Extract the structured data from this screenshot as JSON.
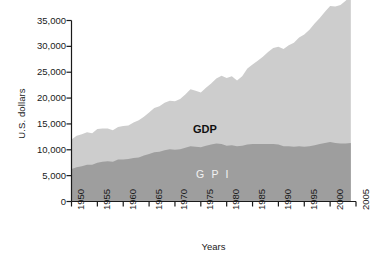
{
  "chart_data": {
    "type": "area",
    "stacked": false,
    "title": "",
    "xlabel": "Years",
    "ylabel": "U.S. dollars",
    "xlim": [
      1950,
      2005
    ],
    "ylim": [
      0,
      35000
    ],
    "ytick_labels": [
      "0",
      "5,000",
      "10,000",
      "15,000",
      "20,000",
      "25,000",
      "30,000",
      "35,000"
    ],
    "ytick_values": [
      0,
      5000,
      10000,
      15000,
      20000,
      25000,
      30000,
      35000
    ],
    "xtick_labels": [
      "1950",
      "1955",
      "1960",
      "1965",
      "1970",
      "1975",
      "1980",
      "1985",
      "1990",
      "1995",
      "2000",
      "2005"
    ],
    "xtick_values": [
      1950,
      1955,
      1960,
      1965,
      1970,
      1975,
      1980,
      1985,
      1990,
      1995,
      2000,
      2005
    ],
    "grid": false,
    "legend_position": "inline-annotation",
    "colors": {
      "gdp_fill": "#cdcdcd",
      "gpi_fill": "#9e9e9e",
      "axis": "#1a1a1a",
      "background": "#ffffff",
      "gdp_label_text": "#111111",
      "gpi_label_text": "#f2f2f2"
    },
    "annotations": [
      {
        "name": "gdp",
        "text": "GDP",
        "x": 1978,
        "y": 16000
      },
      {
        "name": "gpi",
        "text": "G P I",
        "x": 1978,
        "y": 5200
      }
    ],
    "x": [
      1950,
      1951,
      1952,
      1953,
      1954,
      1955,
      1956,
      1957,
      1958,
      1959,
      1960,
      1961,
      1962,
      1963,
      1964,
      1965,
      1966,
      1967,
      1968,
      1969,
      1970,
      1971,
      1972,
      1973,
      1974,
      1975,
      1976,
      1977,
      1978,
      1979,
      1980,
      1981,
      1982,
      1983,
      1984,
      1985,
      1986,
      1987,
      1988,
      1989,
      1990,
      1991,
      1992,
      1993,
      1994,
      1995,
      1996,
      1997,
      1998,
      1999,
      2000,
      2001,
      2002,
      2003,
      2004
    ],
    "series": [
      {
        "name": "GDP",
        "label": "GDP",
        "color": "#cdcdcd",
        "values": [
          12000,
          12700,
          13000,
          13400,
          13200,
          14000,
          14100,
          14100,
          13800,
          14400,
          14600,
          14700,
          15300,
          15700,
          16400,
          17200,
          18100,
          18400,
          19100,
          19500,
          19400,
          19800,
          20700,
          21700,
          21400,
          21100,
          22000,
          22800,
          23800,
          24300,
          23900,
          24200,
          23400,
          24200,
          25700,
          26500,
          27200,
          28000,
          28900,
          29700,
          29900,
          29500,
          30200,
          30700,
          31700,
          32300,
          33200,
          34400,
          35500,
          36700,
          37800,
          37700,
          38000,
          38800,
          40000
        ]
      },
      {
        "name": "GPI",
        "label": "G P I",
        "color": "#9e9e9e",
        "values": [
          6300,
          6600,
          6800,
          7100,
          7100,
          7500,
          7700,
          7800,
          7700,
          8100,
          8100,
          8200,
          8400,
          8500,
          8900,
          9200,
          9500,
          9600,
          9900,
          10100,
          10000,
          10100,
          10400,
          10700,
          10600,
          10500,
          10800,
          11000,
          11200,
          11100,
          10800,
          10900,
          10700,
          10800,
          11000,
          11100,
          11100,
          11100,
          11100,
          11100,
          11000,
          10700,
          10700,
          10600,
          10700,
          10600,
          10700,
          10900,
          11100,
          11300,
          11500,
          11300,
          11200,
          11200,
          11300
        ]
      }
    ]
  },
  "axis": {
    "ylabel": "U.S. dollars",
    "xlabel": "Years"
  }
}
